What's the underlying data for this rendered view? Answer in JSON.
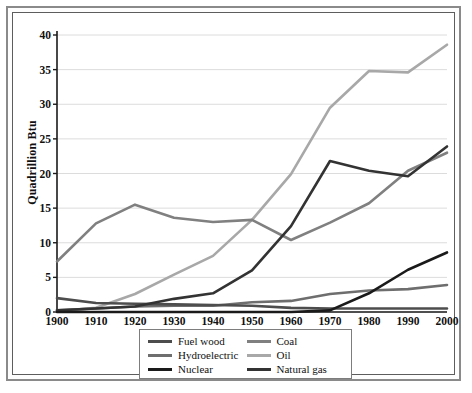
{
  "chart_data": {
    "type": "line",
    "title": "",
    "xlabel": "",
    "ylabel": "Quadrillion Btu",
    "x": [
      1900,
      1910,
      1920,
      1930,
      1940,
      1950,
      1960,
      1970,
      1980,
      1990,
      2000
    ],
    "xlim": [
      1900,
      2000
    ],
    "ylim": [
      0,
      40
    ],
    "yticks": [
      0,
      5,
      10,
      15,
      20,
      25,
      30,
      35,
      40
    ],
    "xticks": [
      "1900",
      "1910",
      "1920",
      "1930",
      "1940",
      "1950",
      "1960",
      "1970",
      "1980",
      "1990",
      "2000"
    ],
    "grid": "horizontal",
    "legend_position": "below-plot",
    "series": [
      {
        "name": "Fuel wood",
        "color": "#4d4d4d",
        "values": [
          2.0,
          1.3,
          1.2,
          1.1,
          1.0,
          0.9,
          0.6,
          0.5,
          0.5,
          0.5,
          0.5
        ]
      },
      {
        "name": "Coal",
        "color": "#808080",
        "values": [
          7.3,
          12.8,
          15.5,
          13.6,
          13.0,
          13.3,
          10.4,
          12.9,
          15.7,
          20.4,
          23.0
        ]
      },
      {
        "name": "Hydroelectric",
        "color": "#6e6e6e",
        "values": [
          0.25,
          0.5,
          0.8,
          0.9,
          0.9,
          1.4,
          1.6,
          2.6,
          3.1,
          3.3,
          3.9
        ]
      },
      {
        "name": "Oil",
        "color": "#a8a8a8",
        "values": [
          0.15,
          0.6,
          2.6,
          5.4,
          8.1,
          13.3,
          19.9,
          29.5,
          34.8,
          34.6,
          38.6
        ]
      },
      {
        "name": "Nuclear",
        "color": "#1a1a1a",
        "values": [
          0.0,
          0.0,
          0.0,
          0.0,
          0.0,
          0.0,
          0.0,
          0.24,
          2.7,
          6.1,
          8.6
        ]
      },
      {
        "name": "Natural gas",
        "color": "#333333",
        "values": [
          0.25,
          0.5,
          0.8,
          1.9,
          2.7,
          6.0,
          12.4,
          21.8,
          20.4,
          19.6,
          23.9
        ]
      }
    ]
  },
  "legend": {
    "items": [
      {
        "label": "Fuel wood",
        "color": "#4d4d4d"
      },
      {
        "label": "Coal",
        "color": "#808080"
      },
      {
        "label": "Hydroelectric",
        "color": "#6e6e6e"
      },
      {
        "label": "Oil",
        "color": "#a8a8a8"
      },
      {
        "label": "Nuclear",
        "color": "#1a1a1a"
      },
      {
        "label": "Natural gas",
        "color": "#333333"
      }
    ]
  },
  "axes": {
    "y_title": "Quadrillion Btu",
    "y_ticks": [
      "0",
      "5",
      "10",
      "15",
      "20",
      "25",
      "30",
      "35",
      "40"
    ],
    "x_ticks": [
      "1900",
      "1910",
      "1920",
      "1930",
      "1940",
      "1950",
      "1960",
      "1970",
      "1980",
      "1990",
      "2000"
    ]
  },
  "style": {
    "grid_color": "#dcdcdc",
    "axis_color": "#1a1a1a",
    "frame_color": "#8a8a8a",
    "plot_background": "#ffffff"
  }
}
